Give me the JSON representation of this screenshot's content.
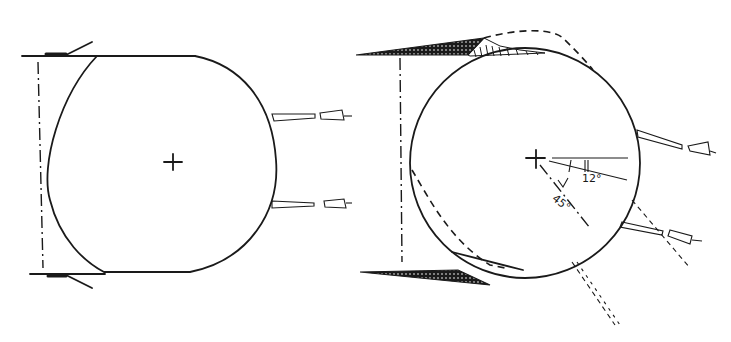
{
  "figure": {
    "left_panel": {
      "description": "Circular section with flattened top and bottom, centre mark, two guns pointing right",
      "center_mark": "+"
    },
    "right_panel": {
      "description": "Circular section rotated, with shaded wedges top and bottom, dashed original outline, centre mark with angle annotations",
      "center_mark": "+",
      "angle_labels": [
        "12°",
        "45°"
      ]
    }
  },
  "labels": {
    "angle_small": "12°",
    "angle_large": "45°"
  },
  "colors": {
    "ink": "#1a1a1a",
    "background": "#ffffff"
  }
}
